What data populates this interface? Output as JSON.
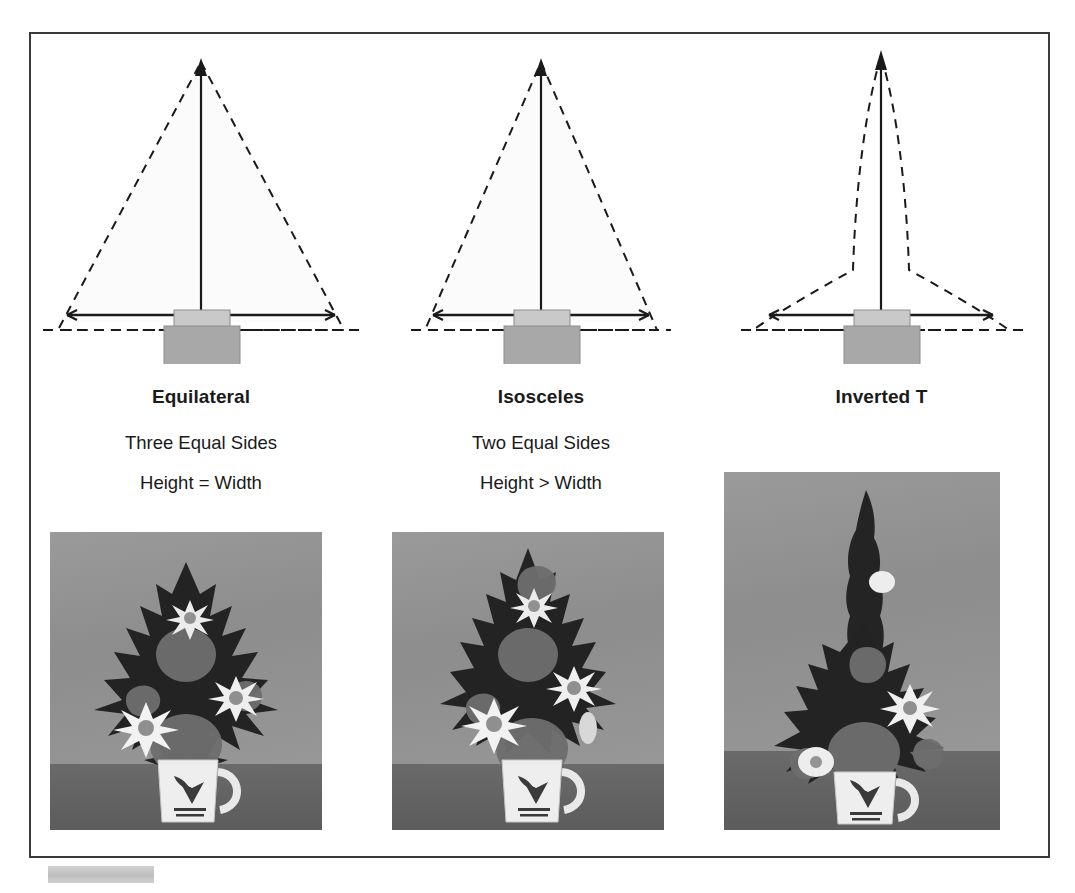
{
  "page": {
    "background_color": "#ffffff",
    "frame_border_color": "#3a3a3a"
  },
  "palette": {
    "line_dark": "#1a1a1a",
    "triangle_fill": "#fbfbfb",
    "block_upper": "#c9c9c9",
    "block_lower": "#a8a8a8",
    "photo_wall": "#939393",
    "photo_table": "#616161",
    "chip_gray": "#c8c8c8"
  },
  "columns": [
    {
      "id": "equilateral",
      "title": "Equilateral",
      "desc_1": "Three Equal Sides",
      "desc_2": "Height = Width",
      "diagram": {
        "outline_style": "dashed",
        "shape": "equilateral-triangle",
        "axis_arrow": "vertical-up-arrow",
        "width_line": "horizontal-double-arrow",
        "baseline": "dashed-horizontal",
        "container": "two-stacked-blocks"
      },
      "photo": {
        "subject": "flower-arrangement-equilateral",
        "vessel": "ceramic-mug",
        "mug_logo_line_1": "PERCY AND PAINTINGS",
        "mug_logo_line_2": "FLOWERS ART SCHOOL"
      }
    },
    {
      "id": "isosceles",
      "title": "Isosceles",
      "desc_1": "Two Equal Sides",
      "desc_2": "Height > Width",
      "diagram": {
        "outline_style": "dashed",
        "shape": "isosceles-triangle",
        "axis_arrow": "vertical-up-arrow",
        "width_line": "horizontal-double-arrow",
        "baseline": "dashed-horizontal",
        "container": "two-stacked-blocks"
      },
      "photo": {
        "subject": "flower-arrangement-isosceles",
        "vessel": "ceramic-mug",
        "mug_logo_line_1": "PERCY AND PAINTINGS",
        "mug_logo_line_2": "FLOWERS ART SCHOOL"
      }
    },
    {
      "id": "inverted-t",
      "title": "Inverted T",
      "desc_1": "",
      "desc_2": "",
      "diagram": {
        "outline_style": "dashed",
        "shape": "inverted-t-flared",
        "axis_arrow": "vertical-up-arrow",
        "width_line": "horizontal-double-arrow",
        "baseline": "dashed-horizontal",
        "container": "two-stacked-blocks"
      },
      "photo": {
        "subject": "flower-arrangement-inverted-t",
        "vessel": "ceramic-mug",
        "mug_logo_line_1": "PERCY AND PAINTINGS",
        "mug_logo_line_2": "FLOWERS ART SCHOOL"
      }
    }
  ],
  "bottom_chip": {
    "name": "gray-swatch",
    "label": ""
  }
}
